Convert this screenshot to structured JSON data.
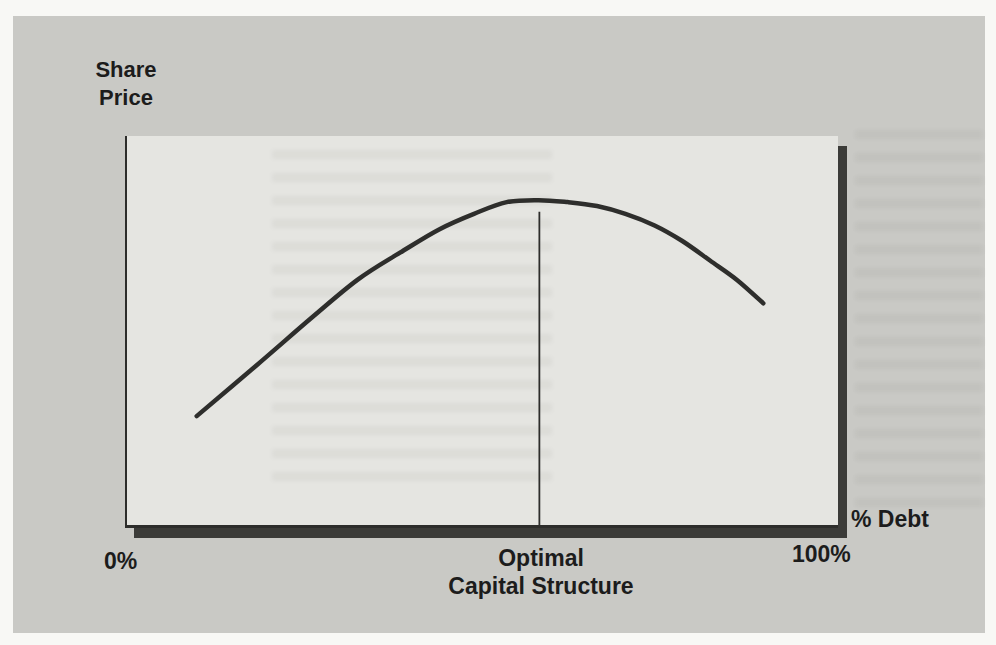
{
  "figure": {
    "y_label_line1": "Share",
    "y_label_line2": "Price",
    "x_axis_label": "% Debt",
    "tick_zero": "0%",
    "tick_optimal_line1": "Optimal",
    "tick_optimal_line2": "Capital Structure",
    "tick_hundred": "100%"
  },
  "colors": {
    "page_bg": "#f8f8f5",
    "panel_bg": "#c9c9c5",
    "plot_bg": "#e5e5e1",
    "axis": "#2d2d2b",
    "shadow": "#3b3b38",
    "curve": "#2e2e2c",
    "text": "#1c1c1c"
  },
  "chart_data": {
    "type": "line",
    "title": "",
    "xlabel": "% Debt",
    "ylabel": "Share Price",
    "x_axis_range_percent": [
      0,
      100
    ],
    "x_tick_labels": [
      "0%",
      "Optimal Capital Structure",
      "100%"
    ],
    "y_axis_note": "unlabeled; values are relative share price (0 = x-axis, 1 = top of plot)",
    "grid": false,
    "legend": false,
    "optimal_x_percent": 58,
    "optimal_line_top_y": 0.805,
    "annotation": "Vertical reference line drops from the curve peak to the x-axis at the optimal capital structure",
    "series": [
      {
        "name": "Share price vs. percent debt",
        "x": [
          9.8,
          18.2,
          25.8,
          32.4,
          38.4,
          43.9,
          48.8,
          53.4,
          57.9,
          62.0,
          66.1,
          70.1,
          74.2,
          78.1,
          82.0,
          85.8,
          89.5
        ],
        "y": [
          0.28,
          0.41,
          0.53,
          0.63,
          0.7,
          0.76,
          0.8,
          0.83,
          0.835,
          0.83,
          0.82,
          0.8,
          0.77,
          0.73,
          0.68,
          0.63,
          0.57
        ]
      }
    ]
  }
}
